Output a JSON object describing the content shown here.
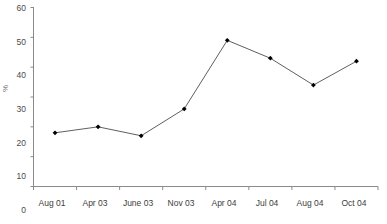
{
  "chart_data": {
    "type": "line",
    "title": "",
    "subtitle": "",
    "xlabel": "",
    "ylabel": "%",
    "categories": [
      "Aug 01",
      "Apr 03",
      "June 03",
      "Nov 03",
      "Apr 04",
      "Jul 04",
      "Aug 04",
      "Oct 04"
    ],
    "values": [
      18,
      20,
      17,
      26,
      49,
      43,
      34,
      42
    ],
    "series": [
      {
        "name": "",
        "values": [
          18,
          20,
          17,
          26,
          49,
          43,
          34,
          42
        ]
      }
    ],
    "ylim": [
      0,
      60
    ],
    "yticks": [
      0,
      10,
      20,
      30,
      40,
      50,
      60
    ],
    "ytick_labels": [
      "0",
      "10",
      "20",
      "30",
      "40",
      "50",
      "60"
    ],
    "grid": false,
    "legend": "none",
    "marker": "filled-diamond",
    "line_color": "#4d4d4d",
    "marker_color": "#000000",
    "axis_color": "#808080",
    "background": "#ffffff",
    "annotations": []
  },
  "axis": {
    "y_label_text": "%",
    "y_ticks": [
      {
        "label": "60",
        "value": 60
      },
      {
        "label": "50",
        "value": 50
      },
      {
        "label": "40",
        "value": 40
      },
      {
        "label": "30",
        "value": 30
      },
      {
        "label": "20",
        "value": 20
      },
      {
        "label": "10",
        "value": 10
      },
      {
        "label": "0",
        "value": 0
      }
    ],
    "x_ticks": [
      {
        "label": "Aug 01"
      },
      {
        "label": "Apr 03"
      },
      {
        "label": "June 03"
      },
      {
        "label": "Nov 03"
      },
      {
        "label": "Apr 04"
      },
      {
        "label": "Jul 04"
      },
      {
        "label": "Aug 04"
      },
      {
        "label": "Oct 04"
      }
    ]
  }
}
